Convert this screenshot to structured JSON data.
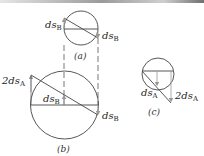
{
  "diagram": {
    "colors": {
      "stroke": "#444444",
      "arrow": "#999999",
      "dashed": "#555555"
    },
    "parts": [
      {
        "id": "a",
        "caption": "(a)",
        "labels": [
          {
            "text": "ds",
            "sub": "B",
            "position": "left"
          },
          {
            "text": "ds",
            "sub": "B",
            "position": "right"
          }
        ]
      },
      {
        "id": "b",
        "caption": "(b)",
        "labels": [
          {
            "text": "2ds",
            "sub": "A",
            "position": "left"
          },
          {
            "text": "ds",
            "sub": "B",
            "position": "center"
          },
          {
            "text": "ds",
            "sub": "B",
            "position": "right"
          }
        ]
      },
      {
        "id": "c",
        "caption": "(c)",
        "labels": [
          {
            "text": "ds",
            "sub": "A",
            "position": "bottom-left"
          },
          {
            "text": "2ds",
            "sub": "A",
            "position": "right"
          }
        ]
      }
    ]
  }
}
